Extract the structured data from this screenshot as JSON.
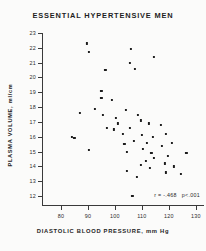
{
  "title": "ESSENTIAL HYPERTENSIVE MEN",
  "stats": {
    "correlation": "r = -.468",
    "pvalue": "p<.001"
  },
  "chart_data": {
    "type": "scatter",
    "title": "ESSENTIAL HYPERTENSIVE MEN",
    "xlabel": "DIASTOLIC BLOOD PRESSURE, mm Hg",
    "ylabel": "PLASMA VOLUME, ml/cm",
    "xlim": [
      73,
      133
    ],
    "ylim": [
      11.4,
      23.0
    ],
    "xticks": [
      80,
      90,
      100,
      110,
      120,
      130
    ],
    "yticks": [
      12,
      13,
      14,
      15,
      16,
      17,
      18,
      19,
      20,
      21,
      22,
      23
    ],
    "grid": false,
    "legend": null,
    "annotations": [
      "r = -.468",
      "p<.001"
    ],
    "marker": "square",
    "marker_color": "#1b1b1b",
    "points": [
      {
        "x": 89.5,
        "y": 22.3
      },
      {
        "x": 90.5,
        "y": 21.7
      },
      {
        "x": 106.0,
        "y": 21.9
      },
      {
        "x": 114.5,
        "y": 21.4
      },
      {
        "x": 105.5,
        "y": 21.0
      },
      {
        "x": 107.5,
        "y": 20.6
      },
      {
        "x": 96.5,
        "y": 20.5
      },
      {
        "x": 95.0,
        "y": 19.1
      },
      {
        "x": 95.0,
        "y": 18.6
      },
      {
        "x": 99.0,
        "y": 18.5
      },
      {
        "x": 87.0,
        "y": 17.6
      },
      {
        "x": 95.5,
        "y": 17.5
      },
      {
        "x": 100.5,
        "y": 17.3
      },
      {
        "x": 92.5,
        "y": 17.9
      },
      {
        "x": 104.0,
        "y": 17.8
      },
      {
        "x": 108.5,
        "y": 17.5
      },
      {
        "x": 109.5,
        "y": 17.1
      },
      {
        "x": 101.0,
        "y": 16.9
      },
      {
        "x": 97.0,
        "y": 16.6
      },
      {
        "x": 99.5,
        "y": 16.5
      },
      {
        "x": 105.5,
        "y": 16.6
      },
      {
        "x": 112.5,
        "y": 16.9
      },
      {
        "x": 117.0,
        "y": 16.8
      },
      {
        "x": 103.0,
        "y": 16.2
      },
      {
        "x": 84.0,
        "y": 16.0
      },
      {
        "x": 85.0,
        "y": 15.9
      },
      {
        "x": 110.0,
        "y": 16.1
      },
      {
        "x": 114.0,
        "y": 16.0
      },
      {
        "x": 119.0,
        "y": 16.2
      },
      {
        "x": 107.0,
        "y": 15.7
      },
      {
        "x": 112.0,
        "y": 15.6
      },
      {
        "x": 117.5,
        "y": 15.4
      },
      {
        "x": 121.0,
        "y": 15.6
      },
      {
        "x": 103.5,
        "y": 15.5
      },
      {
        "x": 110.5,
        "y": 15.2
      },
      {
        "x": 90.5,
        "y": 15.1
      },
      {
        "x": 104.5,
        "y": 15.0
      },
      {
        "x": 113.5,
        "y": 14.9
      },
      {
        "x": 114.5,
        "y": 14.6
      },
      {
        "x": 119.5,
        "y": 14.7
      },
      {
        "x": 126.5,
        "y": 14.9
      },
      {
        "x": 111.5,
        "y": 14.4
      },
      {
        "x": 118.5,
        "y": 14.2
      },
      {
        "x": 109.5,
        "y": 14.1
      },
      {
        "x": 122.0,
        "y": 14.0
      },
      {
        "x": 113.0,
        "y": 13.9
      },
      {
        "x": 119.0,
        "y": 13.6
      },
      {
        "x": 124.5,
        "y": 13.5
      },
      {
        "x": 104.5,
        "y": 13.7
      },
      {
        "x": 108.0,
        "y": 13.3
      },
      {
        "x": 106.5,
        "y": 12.0
      }
    ]
  }
}
